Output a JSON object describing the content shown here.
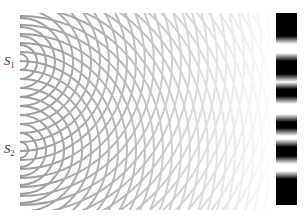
{
  "diagram": {
    "sources": [
      {
        "id": "S1",
        "label": "S",
        "subscript": "1",
        "x": 20,
        "y": 62
      },
      {
        "id": "S2",
        "label": "S",
        "subscript": "2",
        "x": 20,
        "y": 150
      }
    ],
    "wave_region": {
      "x": 20,
      "y": 13,
      "width": 250,
      "height": 197
    },
    "wavefront": {
      "first_radius": 8,
      "spacing": 9,
      "count": 30,
      "stroke_width": 2,
      "color_near": "#9a9a9a",
      "color_far": "#f2f2f2"
    },
    "screen": {
      "x": 276,
      "y": 13,
      "width": 21,
      "height": 192,
      "dark_color": "#000000",
      "light_color": "#ffffff",
      "dark_bands": [
        {
          "y0": 13,
          "y1": 40
        },
        {
          "y0": 57,
          "y1": 78
        },
        {
          "y0": 85,
          "y1": 100
        },
        {
          "y0": 118,
          "y1": 132
        },
        {
          "y0": 143,
          "y1": 160
        },
        {
          "y0": 175,
          "y1": 205
        }
      ]
    },
    "caption": ""
  }
}
